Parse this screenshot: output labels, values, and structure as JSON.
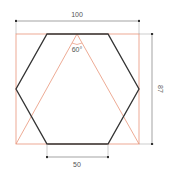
{
  "diagram": {
    "dimensions": {
      "width_label": "100",
      "height_label": "87",
      "side_label": "50",
      "angle_label": "60°"
    },
    "colors": {
      "hexagon": "#333333",
      "construction": "#e8957a",
      "dimension": "#666666",
      "text": "#555555",
      "background": "#ffffff"
    },
    "shapes": {
      "hexagon": "Regular hexagon, side 50, flat top/bottom",
      "bounding_rectangle": "100 x 87 construction rectangle",
      "triangle": "Equilateral construction triangle with 60° apex"
    }
  }
}
